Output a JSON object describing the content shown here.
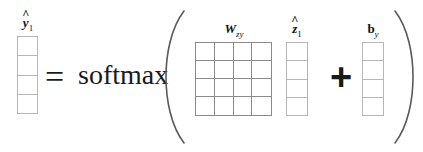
{
  "figure": {
    "type": "equation-diagram",
    "background_color": "#ffffff",
    "grid_line_color": "#8a8a8a",
    "vector_line_color": "#b6b6b6",
    "text_color": "#1a1a1a"
  },
  "equation": {
    "lhs": {
      "label_base": "y",
      "label_hat": "^",
      "label_sub": "1",
      "label_plain": "ŷ₁",
      "name": "output-vector",
      "rows": 4,
      "cols": 1
    },
    "equals_symbol": "=",
    "function_name": "softmax",
    "open_paren": "(",
    "close_paren": ")",
    "terms": [
      {
        "label_base": "W",
        "label_hat": "",
        "label_sub": "zy",
        "label_plain": "W_zy",
        "name": "weight-matrix",
        "rows": 4,
        "cols": 4,
        "kind": "matrix"
      },
      {
        "label_base": "z",
        "label_hat": "^",
        "label_sub": "1",
        "label_plain": "ẑ₁",
        "name": "hidden-state-vector",
        "rows": 4,
        "cols": 1,
        "kind": "vector"
      },
      {
        "label_base": "b",
        "label_hat": "",
        "label_sub": "y",
        "label_plain": "b_y",
        "name": "bias-vector",
        "rows": 4,
        "cols": 1,
        "kind": "vector"
      }
    ],
    "plus_symbol": "+"
  }
}
